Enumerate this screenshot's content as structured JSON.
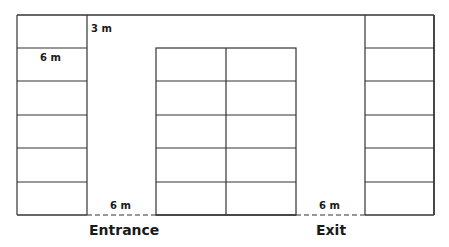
{
  "diagram": {
    "type": "parking-lot-layout",
    "labels": {
      "aisle_width_top": "3 m",
      "space_length": "6 m",
      "entrance_width": "6 m",
      "exit_width": "6 m",
      "entrance": "Entrance",
      "exit": "Exit"
    },
    "geometry": {
      "outer": {
        "x": 17,
        "y": 15,
        "w": 417,
        "h": 200
      },
      "left_column": {
        "x": 17,
        "w": 70,
        "rows": 6
      },
      "right_column": {
        "x": 365,
        "w": 69,
        "rows": 6
      },
      "center_block": {
        "x": 156,
        "y": 48,
        "w": 140,
        "h": 167,
        "cols": 2,
        "rows": 5
      },
      "entrance_gap": {
        "x1": 87,
        "x2": 156
      },
      "exit_gap": {
        "x1": 296,
        "x2": 365
      }
    },
    "colors": {
      "line": "#333333",
      "background": "#ffffff"
    }
  }
}
